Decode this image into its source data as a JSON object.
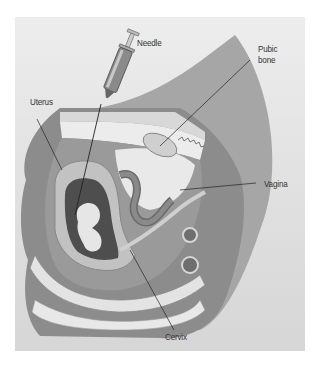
{
  "figure": {
    "colors": {
      "background": "#e6e6e6",
      "body_outer": "#8f8f8f",
      "body_mid": "#a3a3a3",
      "uterus_wall": "#bdbdbd",
      "bone": "#e4e4e4",
      "leader_line": "#222222"
    },
    "labels": {
      "needle": "Needle",
      "pubic_bone_line1": "Pubic",
      "pubic_bone_line2": "bone",
      "uterus": "Uterus",
      "vagina": "Vagina",
      "cervix": "Cervix"
    }
  }
}
